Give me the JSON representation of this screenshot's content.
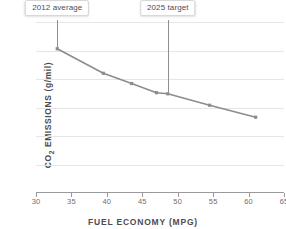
{
  "chart_data": {
    "type": "line",
    "title": "",
    "xlabel": "FUEL ECONOMY (MPG)",
    "ylabel": "CO2 EMISSIONS (g/mil)",
    "ylabel_prefix": "CO",
    "ylabel_sub": "2",
    "ylabel_suffix": " EMISSIONS (g/mil)",
    "xlim": [
      30,
      65
    ],
    "ylim": [
      0,
      300
    ],
    "grid": true,
    "legend": "none",
    "xticks": [
      "30",
      "35",
      "40",
      "45",
      "50",
      "55",
      "60",
      "65"
    ],
    "xtick_values": [
      30,
      35,
      40,
      45,
      50,
      55,
      60,
      65
    ],
    "yticks": [
      "0",
      "50",
      "100",
      "150",
      "200",
      "250",
      "300"
    ],
    "ytick_values": [
      0,
      50,
      100,
      150,
      200,
      250,
      300
    ],
    "x": [
      33,
      39.5,
      43.5,
      47,
      48.6,
      54.5,
      61
    ],
    "values": [
      253,
      210,
      192,
      176,
      174,
      154,
      133
    ],
    "series": [
      {
        "name": "CO2 emissions vs fuel economy",
        "color": "#8c8c8e",
        "marker": "square",
        "points": [
          {
            "x": 33,
            "y": 253
          },
          {
            "x": 39.5,
            "y": 210
          },
          {
            "x": 43.5,
            "y": 192
          },
          {
            "x": 47,
            "y": 176
          },
          {
            "x": 48.6,
            "y": 174
          },
          {
            "x": 54.5,
            "y": 154
          },
          {
            "x": 61,
            "y": 133
          }
        ]
      }
    ],
    "annotations": [
      {
        "id": "annotation-2012-average",
        "label": "2012 average",
        "x": 33,
        "y": 253,
        "stem_to_y": 253
      },
      {
        "id": "annotation-2025-target",
        "label": "2025 target",
        "x": 48.6,
        "y": 174,
        "stem_to_y": 174
      }
    ],
    "colors": {
      "line": "#8c8c8e",
      "marker": "#8c8c8e",
      "grid": "#e6e6e6",
      "axis": "#9a9a9c",
      "text": "#58585a",
      "callout_bg": "#ffffff",
      "callout_border": "#d8d8d8",
      "background": "#ffffff"
    }
  }
}
